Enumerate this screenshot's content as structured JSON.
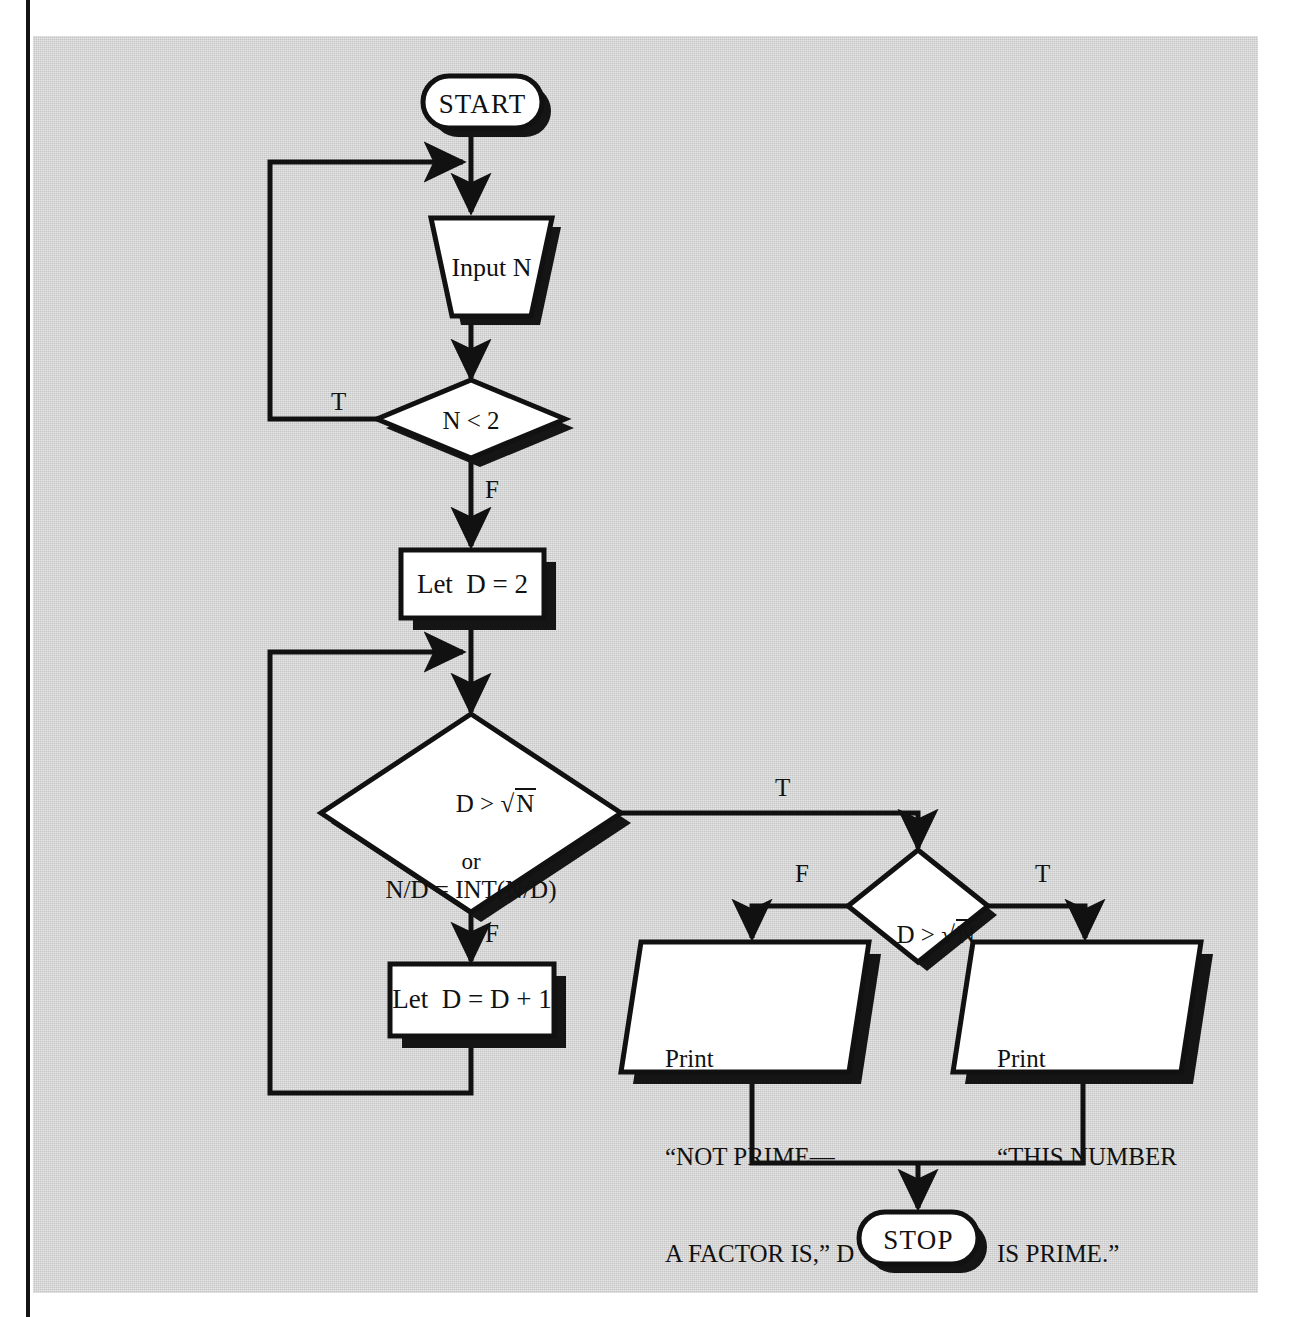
{
  "document": {
    "kind": "flowchart",
    "subject": "Prime number test algorithm",
    "plate_color": "#c6c6c6",
    "ink_color": "#111111",
    "shape_fill": "#ffffff"
  },
  "nodes": {
    "start": {
      "id": "start",
      "shape": "terminator",
      "label": "START"
    },
    "input_n": {
      "id": "input_n",
      "shape": "input-trapezoid",
      "label": "Input N"
    },
    "test_n_lt_2": {
      "id": "test_n_lt_2",
      "shape": "decision",
      "label": "N < 2"
    },
    "let_d_2": {
      "id": "let_d_2",
      "shape": "process",
      "label": "Let  D = 2"
    },
    "test_main": {
      "id": "test_main",
      "shape": "decision",
      "line1_lhs": "D > ",
      "line1_radicand": "N",
      "line2": "or",
      "line3": "N/D = INT(N/D)"
    },
    "let_d_inc": {
      "id": "let_d_inc",
      "shape": "process",
      "label": "Let  D = D + 1"
    },
    "test_d_gt_sqrt": {
      "id": "test_d_gt_sqrt",
      "shape": "decision",
      "lhs": "D > ",
      "radicand": "N"
    },
    "print_not_prime": {
      "id": "print_not_prime",
      "shape": "print-parallelogram",
      "line1": "Print",
      "line2": "“NOT PRIME—",
      "line3": "A FACTOR IS,” D"
    },
    "print_is_prime": {
      "id": "print_is_prime",
      "shape": "print-parallelogram",
      "line1": "Print",
      "line2": "“THIS NUMBER",
      "line3": "IS PRIME.”"
    },
    "stop": {
      "id": "stop",
      "shape": "terminator",
      "label": "STOP"
    }
  },
  "edge_labels": {
    "n_lt_2_true": "T",
    "n_lt_2_false": "F",
    "main_true": "T",
    "main_false": "F",
    "sqrt_false": "F",
    "sqrt_true": "T"
  },
  "edges": [
    {
      "from": "start",
      "to": "input_n",
      "label": ""
    },
    {
      "from": "input_n",
      "to": "test_n_lt_2",
      "label": ""
    },
    {
      "from": "test_n_lt_2",
      "to": "input_n",
      "label": "T",
      "kind": "loop-back-left"
    },
    {
      "from": "test_n_lt_2",
      "to": "let_d_2",
      "label": "F"
    },
    {
      "from": "let_d_2",
      "to": "test_main",
      "label": ""
    },
    {
      "from": "test_main",
      "to": "test_d_gt_sqrt",
      "label": "T"
    },
    {
      "from": "test_main",
      "to": "let_d_inc",
      "label": "F"
    },
    {
      "from": "let_d_inc",
      "to": "test_main",
      "label": "",
      "kind": "loop-back-left"
    },
    {
      "from": "test_d_gt_sqrt",
      "to": "print_not_prime",
      "label": "F"
    },
    {
      "from": "test_d_gt_sqrt",
      "to": "print_is_prime",
      "label": "T"
    },
    {
      "from": "print_not_prime",
      "to": "stop",
      "label": ""
    },
    {
      "from": "print_is_prime",
      "to": "stop",
      "label": ""
    }
  ]
}
